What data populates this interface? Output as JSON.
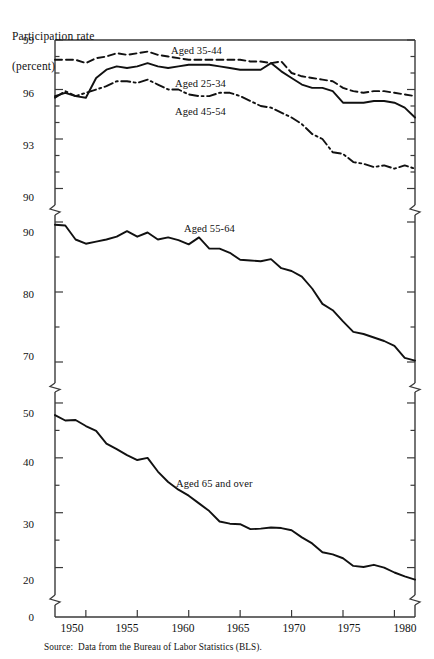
{
  "figure": {
    "y_axis_title_line1": "Participation rate",
    "y_axis_title_line2": "(percent)",
    "source_key": "Source:",
    "source_text": "Data from the Bureau of Labor Statistics (BLS).",
    "ytick_labels": [
      "99",
      "96",
      "93",
      "90",
      "90",
      "80",
      "70",
      "50",
      "40",
      "30",
      "20",
      "0"
    ],
    "xtick_labels": [
      "1950",
      "1955",
      "1960",
      "1965",
      "1970",
      "1975",
      "1980"
    ],
    "series_labels": [
      "Aged 35-44",
      "Aged 25-34",
      "Aged 45-54",
      "Aged 55-64",
      "Aged 65 and over"
    ],
    "line_color": "#111111",
    "axis_color": "#3a3a3a"
  },
  "chart_data": {
    "type": "line",
    "title": "",
    "subtitle": "",
    "xlabel": "",
    "ylabel": "Participation rate (percent)",
    "grid": false,
    "legend": "inline-labels",
    "axis_breaks": [
      {
        "between": [
          90,
          90
        ],
        "note": "break between upper panel (90-99) and middle panel (68-90)"
      },
      {
        "between": [
          68,
          52
        ],
        "note": "break between middle panel (68-90) and lower panel (15-52)"
      },
      {
        "between": [
          15,
          0
        ],
        "note": "break between lower panel (15-52) and zero baseline"
      }
    ],
    "panels": [
      {
        "name": "upper",
        "ylim": [
          89.0,
          99.0
        ],
        "ticks": [
          99,
          96,
          93,
          90
        ]
      },
      {
        "name": "middle",
        "ylim": [
          67.0,
          91.0
        ],
        "ticks": [
          90,
          80,
          70
        ]
      },
      {
        "name": "lower",
        "ylim": [
          15.0,
          52.0
        ],
        "ticks": [
          50,
          40,
          30,
          20
        ]
      },
      {
        "name": "baseline",
        "ylim": [
          0,
          0
        ],
        "ticks": [
          0
        ]
      }
    ],
    "xlim": [
      1947,
      1982
    ],
    "x": [
      1947,
      1948,
      1949,
      1950,
      1951,
      1952,
      1953,
      1954,
      1955,
      1956,
      1957,
      1958,
      1959,
      1960,
      1961,
      1962,
      1963,
      1964,
      1965,
      1966,
      1967,
      1968,
      1969,
      1970,
      1971,
      1972,
      1973,
      1974,
      1975,
      1976,
      1977,
      1978,
      1979,
      1980,
      1981,
      1982
    ],
    "series": [
      {
        "name": "Aged 35-44",
        "style": "dashed",
        "panel": "upper",
        "values": [
          97.8,
          97.8,
          97.8,
          97.6,
          97.9,
          98.0,
          98.2,
          98.1,
          98.2,
          98.3,
          98.1,
          98.0,
          97.9,
          97.8,
          97.8,
          97.8,
          97.8,
          97.8,
          97.8,
          97.7,
          97.7,
          97.6,
          97.7,
          97.0,
          96.8,
          96.7,
          96.6,
          96.5,
          96.1,
          95.9,
          95.8,
          95.9,
          95.9,
          95.8,
          95.7,
          95.6
        ]
      },
      {
        "name": "Aged 25-34",
        "style": "solid",
        "panel": "upper",
        "values": [
          95.6,
          95.8,
          95.6,
          95.5,
          96.7,
          97.2,
          97.4,
          97.3,
          97.4,
          97.6,
          97.4,
          97.3,
          97.4,
          97.5,
          97.5,
          97.5,
          97.4,
          97.3,
          97.2,
          97.2,
          97.2,
          97.6,
          97.1,
          96.7,
          96.3,
          96.1,
          96.1,
          95.9,
          95.2,
          95.2,
          95.2,
          95.3,
          95.3,
          95.2,
          94.9,
          94.3
        ]
      },
      {
        "name": "Aged 45-54",
        "style": "dashdot",
        "panel": "upper",
        "values": [
          95.5,
          95.9,
          95.6,
          95.8,
          96.0,
          96.2,
          96.5,
          96.5,
          96.4,
          96.6,
          96.3,
          96.0,
          96.0,
          95.7,
          95.6,
          95.6,
          95.8,
          95.8,
          95.6,
          95.3,
          95.0,
          94.9,
          94.6,
          94.3,
          93.9,
          93.3,
          93.0,
          92.2,
          92.1,
          91.6,
          91.5,
          91.3,
          91.4,
          91.2,
          91.4,
          91.2
        ]
      },
      {
        "name": "Aged 55-64",
        "style": "solid",
        "panel": "middle",
        "values": [
          89.6,
          89.5,
          87.5,
          86.9,
          87.2,
          87.5,
          87.9,
          88.7,
          87.9,
          88.5,
          87.5,
          87.8,
          87.4,
          86.8,
          87.8,
          86.2,
          86.2,
          85.6,
          84.6,
          84.5,
          84.4,
          84.7,
          83.4,
          83.0,
          82.2,
          80.5,
          78.3,
          77.4,
          75.8,
          74.3,
          74.0,
          73.5,
          73.0,
          72.3,
          70.6,
          70.2
        ]
      },
      {
        "name": "Aged 65 and over",
        "style": "solid",
        "panel": "lower",
        "values": [
          47.8,
          46.8,
          46.9,
          45.8,
          44.9,
          42.6,
          41.6,
          40.5,
          39.6,
          40.0,
          37.5,
          35.6,
          34.2,
          33.1,
          31.7,
          30.3,
          28.4,
          28.0,
          27.9,
          27.0,
          27.1,
          27.3,
          27.2,
          26.8,
          25.5,
          24.4,
          22.8,
          22.4,
          21.7,
          20.3,
          20.1,
          20.5,
          20.0,
          19.1,
          18.4,
          17.8
        ]
      }
    ]
  }
}
